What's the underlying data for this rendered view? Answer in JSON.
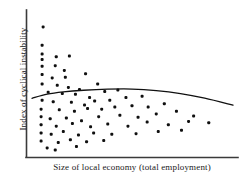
{
  "chart_data": {
    "type": "scatter",
    "title": "",
    "xlabel": "Size of local economy (total employment)",
    "ylabel": "Index of cyclical instability",
    "xlim": [
      0,
      100
    ],
    "ylim": [
      0,
      100
    ],
    "grid": false,
    "legend": null,
    "axis_ticks": {
      "x": [],
      "y": []
    },
    "marker": {
      "shape": "square-dot",
      "size_px": 3,
      "color": "#101010"
    },
    "points": [
      {
        "x": 6.0,
        "y": 92.0
      },
      {
        "x": 5.5,
        "y": 78.5
      },
      {
        "x": 5.5,
        "y": 72.0
      },
      {
        "x": 5.5,
        "y": 68.0
      },
      {
        "x": 5.5,
        "y": 63.0
      },
      {
        "x": 12.5,
        "y": 70.0
      },
      {
        "x": 19.0,
        "y": 70.5
      },
      {
        "x": 12.0,
        "y": 63.5
      },
      {
        "x": 16.5,
        "y": 60.0
      },
      {
        "x": 5.5,
        "y": 57.0
      },
      {
        "x": 10.5,
        "y": 54.5
      },
      {
        "x": 17.0,
        "y": 55.0
      },
      {
        "x": 27.0,
        "y": 57.5
      },
      {
        "x": 5.5,
        "y": 50.0
      },
      {
        "x": 13.0,
        "y": 49.0
      },
      {
        "x": 18.5,
        "y": 47.5
      },
      {
        "x": 24.0,
        "y": 46.0
      },
      {
        "x": 33.0,
        "y": 50.0
      },
      {
        "x": 8.5,
        "y": 44.0
      },
      {
        "x": 15.5,
        "y": 43.0
      },
      {
        "x": 22.0,
        "y": 42.5
      },
      {
        "x": 29.0,
        "y": 40.0
      },
      {
        "x": 36.5,
        "y": 44.5
      },
      {
        "x": 43.0,
        "y": 45.5
      },
      {
        "x": 5.5,
        "y": 38.0
      },
      {
        "x": 11.0,
        "y": 37.0
      },
      {
        "x": 20.0,
        "y": 36.5
      },
      {
        "x": 26.5,
        "y": 34.5
      },
      {
        "x": 31.5,
        "y": 37.5
      },
      {
        "x": 39.0,
        "y": 38.0
      },
      {
        "x": 47.0,
        "y": 40.0
      },
      {
        "x": 55.0,
        "y": 41.0
      },
      {
        "x": 5.0,
        "y": 31.5
      },
      {
        "x": 14.0,
        "y": 31.0
      },
      {
        "x": 21.5,
        "y": 30.0
      },
      {
        "x": 28.0,
        "y": 32.0
      },
      {
        "x": 35.0,
        "y": 31.5
      },
      {
        "x": 41.5,
        "y": 33.0
      },
      {
        "x": 50.0,
        "y": 34.0
      },
      {
        "x": 58.0,
        "y": 33.0
      },
      {
        "x": 66.0,
        "y": 35.5
      },
      {
        "x": 5.0,
        "y": 26.0
      },
      {
        "x": 9.5,
        "y": 24.5
      },
      {
        "x": 17.5,
        "y": 25.0
      },
      {
        "x": 25.0,
        "y": 23.0
      },
      {
        "x": 33.5,
        "y": 26.0
      },
      {
        "x": 44.0,
        "y": 27.0
      },
      {
        "x": 53.0,
        "y": 25.5
      },
      {
        "x": 62.0,
        "y": 28.0
      },
      {
        "x": 72.0,
        "y": 30.0
      },
      {
        "x": 80.5,
        "y": 26.5
      },
      {
        "x": 5.0,
        "y": 20.0
      },
      {
        "x": 12.5,
        "y": 19.0
      },
      {
        "x": 20.5,
        "y": 21.0
      },
      {
        "x": 29.5,
        "y": 18.5
      },
      {
        "x": 38.0,
        "y": 20.5
      },
      {
        "x": 48.0,
        "y": 19.0
      },
      {
        "x": 57.5,
        "y": 22.0
      },
      {
        "x": 68.0,
        "y": 20.0
      },
      {
        "x": 78.0,
        "y": 22.5
      },
      {
        "x": 88.0,
        "y": 21.5
      },
      {
        "x": 5.0,
        "y": 14.0
      },
      {
        "x": 10.0,
        "y": 13.0
      },
      {
        "x": 16.0,
        "y": 15.0
      },
      {
        "x": 23.5,
        "y": 12.5
      },
      {
        "x": 31.0,
        "y": 14.0
      },
      {
        "x": 40.0,
        "y": 13.0
      },
      {
        "x": 52.0,
        "y": 13.5
      },
      {
        "x": 63.0,
        "y": 15.0
      },
      {
        "x": 74.5,
        "y": 16.0
      },
      {
        "x": 5.0,
        "y": 8.0
      },
      {
        "x": 13.5,
        "y": 7.0
      },
      {
        "x": 19.5,
        "y": 9.0
      },
      {
        "x": 27.5,
        "y": 7.5
      },
      {
        "x": 36.0,
        "y": 8.5
      },
      {
        "x": 8.0,
        "y": 3.0
      },
      {
        "x": 12.0,
        "y": 1.5
      },
      {
        "x": 22.5,
        "y": 4.0
      }
    ],
    "trend_line": {
      "label": "fitted trend",
      "color": "#101010",
      "points": [
        {
          "x": 0.5,
          "y": 39.5
        },
        {
          "x": 8.0,
          "y": 42.5
        },
        {
          "x": 16.0,
          "y": 44.2
        },
        {
          "x": 26.0,
          "y": 45.4
        },
        {
          "x": 38.0,
          "y": 46.2
        },
        {
          "x": 50.0,
          "y": 46.3
        },
        {
          "x": 62.0,
          "y": 45.2
        },
        {
          "x": 74.0,
          "y": 43.0
        },
        {
          "x": 86.0,
          "y": 39.6
        },
        {
          "x": 100.0,
          "y": 34.5
        }
      ]
    }
  },
  "axes": {
    "x_label": "Size of local economy (total employment)",
    "y_label": "Index of cyclical instability",
    "line_color": "#3a3a3a"
  }
}
